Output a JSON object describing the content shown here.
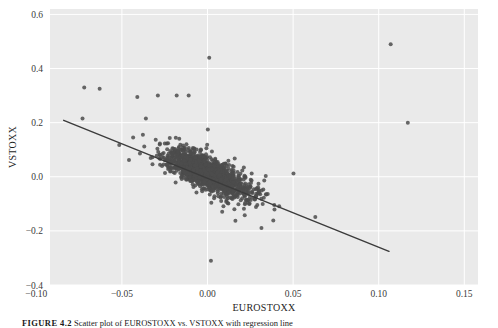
{
  "figure": {
    "caption_label": "FIGURE 4.2",
    "caption_text": "   Scatter plot of EUROSTOXX vs. VSTOXX with regression line"
  },
  "chart_data": {
    "type": "scatter",
    "title": "",
    "xlabel": "EUROSTOXX",
    "ylabel": "VSTOXX",
    "xlim": [
      -0.092,
      0.158
    ],
    "ylim": [
      -0.4,
      0.62
    ],
    "xticks": [
      -0.1,
      -0.05,
      0.0,
      0.05,
      0.1,
      0.15
    ],
    "xticklabels": [
      "-0.10",
      "-0.05",
      "0.00",
      "0.05",
      "0.10",
      "0.15"
    ],
    "yticks": [
      -0.4,
      -0.2,
      0.0,
      0.2,
      0.4,
      0.6
    ],
    "yticklabels": [
      "-0.4",
      "-0.2",
      "0.0",
      "0.2",
      "0.4",
      "0.6"
    ],
    "grid": true,
    "grid_color": "#ffffff",
    "axes_facecolor": "#eaeaea",
    "figure_facecolor": "#ffffff",
    "point_color": "#4c4c4c",
    "point_size": 3.0,
    "point_alpha": 0.85,
    "n_points": 1500,
    "correlation": -0.72,
    "regression": {
      "slope": -2.55,
      "intercept": -0.0055,
      "color": "#3b3b3b",
      "linewidth": 1.4,
      "x_start": -0.084,
      "x_end": 0.106
    },
    "outliers": [
      {
        "x": 0.001,
        "y": 0.44
      },
      {
        "x": 0.107,
        "y": 0.49
      },
      {
        "x": -0.072,
        "y": 0.33
      },
      {
        "x": -0.063,
        "y": 0.325
      },
      {
        "x": -0.041,
        "y": 0.295
      },
      {
        "x": -0.029,
        "y": 0.3
      },
      {
        "x": -0.018,
        "y": 0.3
      },
      {
        "x": -0.011,
        "y": 0.3
      },
      {
        "x": -0.073,
        "y": 0.215
      },
      {
        "x": -0.036,
        "y": 0.215
      },
      {
        "x": 0.117,
        "y": 0.2
      },
      {
        "x": 0.002,
        "y": -0.31
      }
    ]
  }
}
